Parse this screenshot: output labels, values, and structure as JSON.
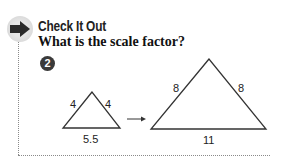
{
  "section": {
    "heading": "Check It Out",
    "question": "What is the scale factor?",
    "example_number": "2",
    "icon": "arrow-right-icon"
  },
  "figure": {
    "small_triangle": {
      "left_side": "4",
      "right_side": "4",
      "base": "5.5"
    },
    "large_triangle": {
      "left_side": "8",
      "right_side": "8",
      "base": "11"
    },
    "transform_arrow": "right-arrow"
  }
}
